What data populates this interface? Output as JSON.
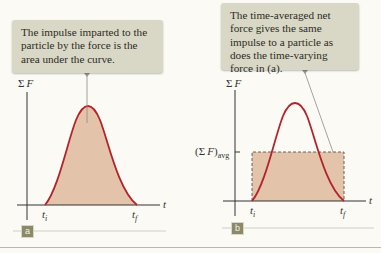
{
  "panels": {
    "a": {
      "badge": "a",
      "callout": "The impulse imparted to the particle by the force is the area under the curve.",
      "y_axis_label": {
        "sigma": "Σ",
        "var": "F"
      },
      "x_axis_label": "t",
      "ticks": {
        "ti": {
          "base": "t",
          "sub": "i"
        },
        "tf": {
          "base": "t",
          "sub": "f"
        }
      }
    },
    "b": {
      "badge": "b",
      "callout": "The time-averaged net force gives the same impulse to a particle as does the time-varying force in (a).",
      "y_axis_label": {
        "sigma": "Σ",
        "var": "F"
      },
      "x_axis_label": "t",
      "avg_label": {
        "open": "(Σ",
        "var": "F",
        "close": ")",
        "sub": "avg"
      },
      "ticks": {
        "ti": {
          "base": "t",
          "sub": "i"
        },
        "tf": {
          "base": "t",
          "sub": "f"
        }
      }
    }
  },
  "colors": {
    "curve": "#b3242a",
    "fill": "#e3c3aa",
    "callout_bg": "#d9d8c6",
    "badge_bg": "#8a8a6a",
    "axis": "#333333"
  }
}
